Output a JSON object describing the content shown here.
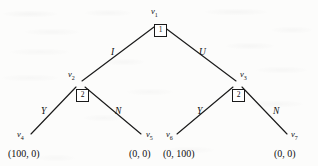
{
  "figure": {
    "kind": "extensive-form-game-tree",
    "background_color": "#fcfcfb",
    "ink_color": "#1a1a1a"
  },
  "nodes": {
    "root": {
      "name": "v",
      "index": "1",
      "player": "1",
      "x": 159,
      "y": 22
    },
    "left_decision": {
      "name": "v",
      "index": "2",
      "player": "2",
      "x": 80,
      "y": 83
    },
    "right_decision": {
      "name": "v",
      "index": "3",
      "player": "2",
      "x": 238,
      "y": 83
    }
  },
  "leaves": [
    {
      "name": "v",
      "index": "4",
      "payoff": "(100, 0)",
      "x": 30,
      "y": 136
    },
    {
      "name": "v",
      "index": "5",
      "payoff": "(0, 0)",
      "x": 143,
      "y": 136
    },
    {
      "name": "v",
      "index": "6",
      "payoff": "(0, 100)",
      "x": 175,
      "y": 136
    },
    {
      "name": "v",
      "index": "7",
      "payoff": "(0, 0)",
      "x": 288,
      "y": 136
    }
  ],
  "actions": {
    "root_left": "I",
    "root_right": "U",
    "left_yes": "Y",
    "left_no": "N",
    "right_yes": "Y",
    "right_no": "N"
  },
  "payoffs": {
    "v4": "(100, 0)",
    "v5": "(0, 0)",
    "v6": "(0, 100)",
    "v7": "(0, 0)"
  },
  "players": {
    "first": "1",
    "second": "2"
  }
}
